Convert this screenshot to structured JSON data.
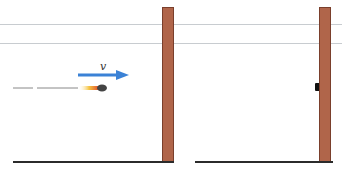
{
  "diagram": {
    "title": "",
    "panels": [
      {
        "name": "before-collision",
        "velocity_label": "v",
        "elements": [
          "bullet",
          "motion-trail",
          "velocity-arrow",
          "wall",
          "ground"
        ]
      },
      {
        "name": "after-collision",
        "elements": [
          "embedded-bullet",
          "wall",
          "ground"
        ]
      }
    ],
    "colors": {
      "wall": "#b0654a",
      "wall_border": "#7a3f2c",
      "arrow": "#3b82d6",
      "ground": "#2b2b2b",
      "bullet": "#444444"
    }
  }
}
